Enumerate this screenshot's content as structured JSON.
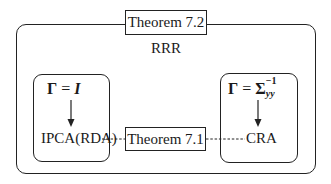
{
  "diagram": {
    "top_theorem": "Theorem 7.2",
    "outer_label": "RRR",
    "left_box": {
      "formula_lhs": "Γ",
      "formula_eq": " = ",
      "formula_rhs": "I",
      "method": "IPCA(RDA)"
    },
    "right_box": {
      "formula_lhs": "Γ",
      "formula_eq": " = ",
      "formula_rhs": "Σ",
      "formula_sup": "−1",
      "formula_sub": "yy",
      "method": "CRA"
    },
    "middle_theorem": "Theorem 7.1",
    "colors": {
      "line": "#222222",
      "background": "#ffffff"
    }
  }
}
